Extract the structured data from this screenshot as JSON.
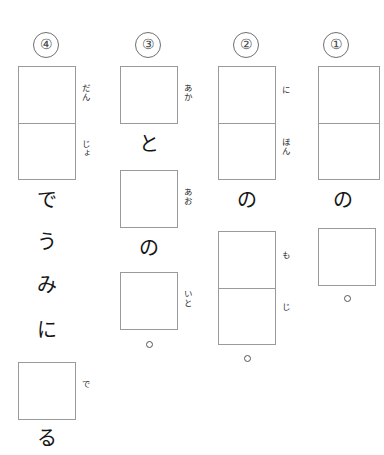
{
  "worksheet": {
    "title": "Japanese kanji writing practice sheet",
    "reading_direction": "vertical right-to-left",
    "columns": [
      {
        "number": "①",
        "number_name": "item-number-1",
        "boxes": [
          {
            "cells": 2,
            "furigana": ""
          },
          {
            "cells": 1,
            "furigana": ""
          }
        ],
        "kana": [
          "の"
        ],
        "has_period": true
      },
      {
        "number": "②",
        "number_name": "item-number-2",
        "boxes": [
          {
            "cells": 2,
            "furigana_top": "に",
            "furigana_bottom": "ほん"
          },
          {
            "cells": 2,
            "furigana_top": "も",
            "furigana_bottom": "じ"
          }
        ],
        "kana": [
          "の"
        ],
        "has_period": true
      },
      {
        "number": "③",
        "number_name": "item-number-3",
        "boxes": [
          {
            "cells": 1,
            "furigana": "あか"
          },
          {
            "cells": 1,
            "furigana": "あお"
          },
          {
            "cells": 1,
            "furigana": "いと"
          }
        ],
        "kana": [
          "と",
          "の"
        ],
        "has_period": true
      },
      {
        "number": "④",
        "number_name": "item-number-4",
        "boxes": [
          {
            "cells": 2,
            "furigana_top": "だん",
            "furigana_bottom": "じょ"
          },
          {
            "cells": 1,
            "furigana": "で"
          }
        ],
        "kana": [
          "で",
          "う",
          "み",
          "に",
          "る"
        ],
        "has_period": false
      }
    ]
  },
  "col4": {
    "number": "④",
    "furigana_dan": "だん",
    "furigana_jo": "じょ",
    "kana_de": "で",
    "kana_u": "う",
    "kana_mi": "み",
    "kana_ni": "に",
    "furigana_de": "で",
    "kana_ru": "る"
  },
  "col3": {
    "number": "③",
    "furigana_aka": "あか",
    "kana_to": "と",
    "furigana_ao": "あお",
    "kana_no": "の",
    "furigana_ito": "いと"
  },
  "col2": {
    "number": "②",
    "furigana_ni": "に",
    "furigana_hon": "ほん",
    "kana_no": "の",
    "furigana_mo": "も",
    "furigana_ji": "じ"
  },
  "col1": {
    "number": "①",
    "kana_no": "の"
  },
  "colors": {
    "box_border": "#9a9a9a",
    "ink": "#151515",
    "number_border": "#6f6f6f",
    "paper": "#ffffff"
  }
}
